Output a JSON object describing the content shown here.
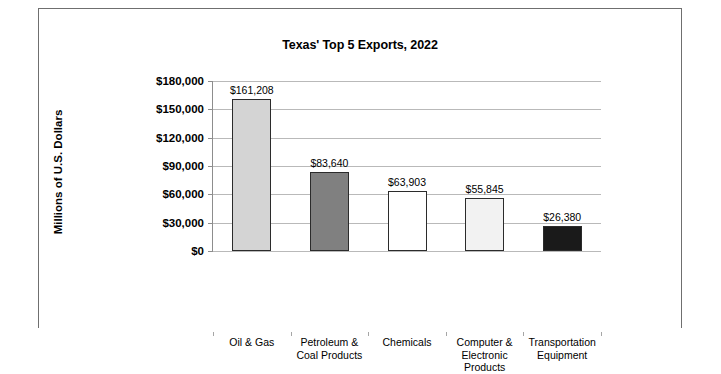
{
  "chart_data": {
    "type": "bar",
    "title": "Texas' Top 5 Exports, 2022",
    "xlabel": "",
    "ylabel": "Millions of U.S. Dollars",
    "categories": [
      "Oil & Gas",
      "Petroleum & Coal Products",
      "Chemicals",
      "Computer & Electronic Products",
      "Transportation Equipment"
    ],
    "values": [
      161208,
      83640,
      63903,
      55845,
      26380
    ],
    "value_labels": [
      "$161,208",
      "$83,640",
      "$63,903",
      "$55,845",
      "$26,380"
    ],
    "ylim": [
      0,
      180000
    ],
    "ytick_values": [
      0,
      30000,
      60000,
      90000,
      120000,
      150000,
      180000
    ],
    "ytick_labels": [
      "$0",
      "$30,000",
      "$60,000",
      "$90,000",
      "$120,000",
      "$150,000",
      "$180,000"
    ],
    "grid": true,
    "legend": "none",
    "bar_colors": [
      "#d4d4d4",
      "#808080",
      "#ffffff",
      "#f2f2f2",
      "#1a1a1a"
    ],
    "bar_outline_color": "#2b2b2b",
    "gridline_color": "#b9b9b9",
    "axis_color": "#8d8d8d",
    "plot_background": "#ffffff"
  },
  "category_lines": [
    [
      "Oil & Gas"
    ],
    [
      "Petroleum &",
      "Coal Products"
    ],
    [
      "Chemicals"
    ],
    [
      "Computer &",
      "Electronic",
      "Products"
    ],
    [
      "Transportation",
      "Equipment"
    ]
  ]
}
